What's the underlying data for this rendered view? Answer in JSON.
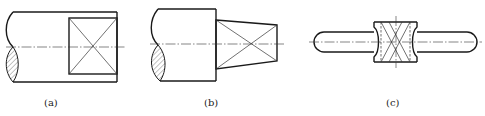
{
  "figure": {
    "panels": [
      {
        "id": "a",
        "caption": "(a)",
        "description": "Cylindrical shaft end with square flat (diagonal cross marks flat surface)"
      },
      {
        "id": "b",
        "caption": "(b)",
        "description": "Cylindrical shaft with tapered square end (diagonal cross marks flat surface)"
      },
      {
        "id": "c",
        "caption": "(c)",
        "description": "Rod with rounded ends and central square section with hidden lines and diagonal crosses"
      }
    ]
  }
}
